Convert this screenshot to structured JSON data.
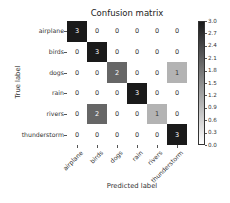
{
  "chart_data": {
    "type": "heatmap",
    "title": "Confusion matrix",
    "xlabel": "Predicted label",
    "ylabel": "True label",
    "x_categories": [
      "airplane",
      "birds",
      "dogs",
      "rain",
      "rivers",
      "thunderstorm"
    ],
    "y_categories": [
      "airplane",
      "birds",
      "dogs",
      "rain",
      "rivers",
      "thunderstorm"
    ],
    "values": [
      [
        3,
        0,
        0,
        0,
        0,
        0
      ],
      [
        0,
        3,
        0,
        0,
        0,
        0
      ],
      [
        0,
        0,
        2,
        0,
        0,
        1
      ],
      [
        0,
        0,
        0,
        3,
        0,
        0
      ],
      [
        0,
        2,
        0,
        0,
        1,
        0
      ],
      [
        0,
        0,
        0,
        0,
        0,
        3
      ]
    ],
    "colorbar": {
      "min": 0.0,
      "max": 3.0,
      "ticks": [
        "3.0",
        "2.7",
        "2.4",
        "2.1",
        "1.8",
        "1.5",
        "1.2",
        "0.9",
        "0.6",
        "0.3",
        "0.0"
      ],
      "colormap": "Greys"
    }
  }
}
